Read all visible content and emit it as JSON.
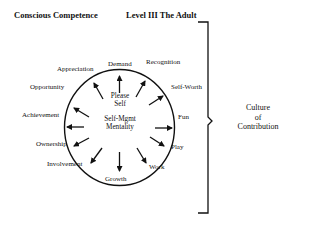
{
  "header": {
    "left_title": "Conscious Competence",
    "right_title": "Level III  The Adult"
  },
  "diagram": {
    "center": {
      "line1": "Please",
      "line2": "Self",
      "line3": "Self-Mgmt",
      "line4": "Mentality"
    },
    "labels": {
      "demand": "Demand",
      "recognition": "Recognition",
      "self_worth": "Self-Worth",
      "fun": "Fun",
      "play": "Play",
      "work": "Work",
      "growth": "Growth",
      "involvement": "Involvement",
      "ownership": "Ownership",
      "achievement": "Achievement",
      "opportunity": "Opportunity",
      "appreciation": "Appreciation"
    },
    "arrow_directions": {
      "demand": "out",
      "recognition": "out",
      "self_worth": "in",
      "fun": "in",
      "play": "in",
      "work": "in",
      "growth": "in",
      "involvement": "in",
      "ownership": "in",
      "achievement": "out",
      "opportunity": "in",
      "appreciation": "in"
    },
    "bracket_label": {
      "line1": "Culture",
      "line2": "of",
      "line3": "Contribution"
    }
  }
}
